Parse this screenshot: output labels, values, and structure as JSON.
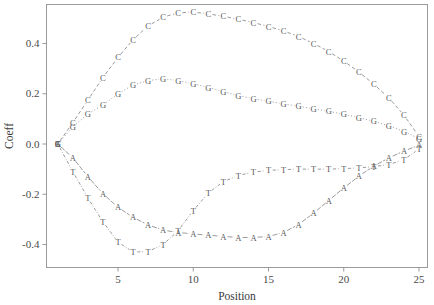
{
  "chart_data": {
    "type": "line",
    "title": "",
    "xlabel": "Position",
    "ylabel": "Coeff",
    "xlim": [
      1,
      25
    ],
    "ylim": [
      -0.46,
      0.56
    ],
    "grid": false,
    "legend": "none",
    "legend_style": "point-markers-are-series-letters",
    "xticks": [
      5,
      10,
      15,
      20,
      25
    ],
    "xtick_labels": [
      "5",
      "10",
      "15",
      "20",
      "25"
    ],
    "yticks": [
      0.4,
      0.2,
      0.0,
      -0.2,
      -0.4
    ],
    "ytick_labels": [
      "0.4",
      "0.2",
      "0.0",
      "-0.2",
      "-0.4"
    ],
    "x": [
      1,
      2,
      3,
      4,
      5,
      6,
      7,
      8,
      9,
      10,
      11,
      12,
      13,
      14,
      15,
      16,
      17,
      18,
      19,
      20,
      21,
      22,
      23,
      24,
      25
    ],
    "series": [
      {
        "name": "C",
        "marker": "C",
        "linestyle": "dashed",
        "color": "#8e8e8e",
        "values": [
          0.0,
          0.085,
          0.175,
          0.265,
          0.345,
          0.415,
          0.47,
          0.505,
          0.522,
          0.525,
          0.518,
          0.508,
          0.497,
          0.483,
          0.468,
          0.45,
          0.428,
          0.4,
          0.368,
          0.33,
          0.287,
          0.238,
          0.183,
          0.115,
          0.03
        ]
      },
      {
        "name": "G",
        "marker": "G",
        "linestyle": "dotted",
        "color": "#8e8e8e",
        "values": [
          0.0,
          0.068,
          0.12,
          0.155,
          0.2,
          0.235,
          0.252,
          0.26,
          0.252,
          0.24,
          0.225,
          0.208,
          0.193,
          0.18,
          0.17,
          0.16,
          0.15,
          0.14,
          0.13,
          0.118,
          0.105,
          0.09,
          0.072,
          0.05,
          0.022
        ]
      },
      {
        "name": "T",
        "marker": "T",
        "linestyle": "dashdot",
        "color": "#8e8e8e",
        "values": [
          0.0,
          -0.11,
          -0.215,
          -0.31,
          -0.39,
          -0.43,
          -0.428,
          -0.4,
          -0.345,
          -0.265,
          -0.195,
          -0.15,
          -0.125,
          -0.112,
          -0.105,
          -0.102,
          -0.1,
          -0.1,
          -0.1,
          -0.098,
          -0.095,
          -0.09,
          -0.082,
          -0.062,
          -0.02
        ]
      },
      {
        "name": "A",
        "marker": "A",
        "linestyle": "solid-dashed",
        "color": "#7a7a7a",
        "values": [
          0.0,
          -0.055,
          -0.13,
          -0.198,
          -0.252,
          -0.292,
          -0.322,
          -0.343,
          -0.352,
          -0.358,
          -0.363,
          -0.368,
          -0.372,
          -0.372,
          -0.368,
          -0.352,
          -0.32,
          -0.275,
          -0.225,
          -0.175,
          -0.128,
          -0.088,
          -0.055,
          -0.028,
          -0.005
        ]
      }
    ]
  }
}
